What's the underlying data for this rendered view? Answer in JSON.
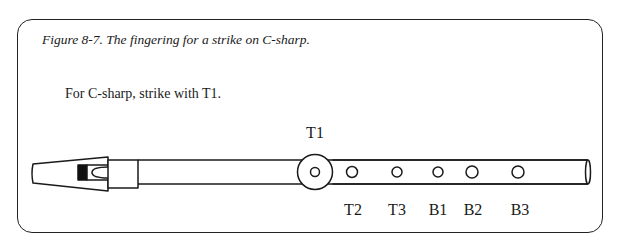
{
  "figure": {
    "caption": "Figure 8-7. The fingering for a strike on C-sharp.",
    "instruction": "For C-sharp, strike with T1.",
    "highlighted_hole": "T1",
    "highlight_label": "T1"
  },
  "whistle": {
    "holes": [
      {
        "id": "T1",
        "label": "T1",
        "x": 315,
        "r": 4.5,
        "highlighted": true,
        "label_position": "above"
      },
      {
        "id": "T2",
        "label": "T2",
        "x": 352,
        "r": 5.5,
        "highlighted": false,
        "label_position": "below"
      },
      {
        "id": "T3",
        "label": "T3",
        "x": 397,
        "r": 5,
        "highlighted": false,
        "label_position": "below"
      },
      {
        "id": "B1",
        "label": "B1",
        "x": 438,
        "r": 5,
        "highlighted": false,
        "label_position": "below"
      },
      {
        "id": "B2",
        "label": "B2",
        "x": 472,
        "r": 6,
        "highlighted": false,
        "label_position": "below"
      },
      {
        "id": "B3",
        "label": "B3",
        "x": 518,
        "r": 6,
        "highlighted": false,
        "label_position": "below"
      }
    ]
  }
}
